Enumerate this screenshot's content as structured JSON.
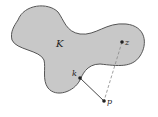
{
  "diagram": {
    "shape_label": "K",
    "points": {
      "z": {
        "label": "z",
        "x": 122,
        "y": 42
      },
      "k": {
        "label": "k",
        "x": 80,
        "y": 78
      },
      "p": {
        "label": "p",
        "x": 104,
        "y": 101
      }
    },
    "colors": {
      "fill": "#c8c8c8",
      "stroke": "#555555",
      "line": "#333333",
      "dashed": "#888888"
    }
  }
}
